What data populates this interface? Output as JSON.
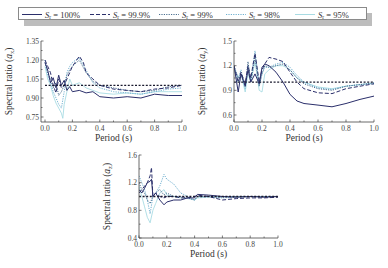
{
  "legend": {
    "entries": [
      {
        "label_main": "S",
        "label_sub": "r",
        "label_rest": " = 100%",
        "style": "solid",
        "color": "#2b2f6b"
      },
      {
        "label_main": "S",
        "label_sub": "r",
        "label_rest": " = 99.9%",
        "style": "dashed",
        "color": "#2b2f6b"
      },
      {
        "label_main": "S",
        "label_sub": "r",
        "label_rest": " = 99%",
        "style": "dotted",
        "color": "#4a6f8f"
      },
      {
        "label_main": "S",
        "label_sub": "r",
        "label_rest": " = 98%",
        "style": "dotted",
        "color": "#6fb0d0"
      },
      {
        "label_main": "S",
        "label_sub": "r",
        "label_rest": " = 95%",
        "style": "solid",
        "color": "#a8dbe3"
      }
    ]
  },
  "chart_data": [
    {
      "type": "line",
      "title": "",
      "xlabel": "Period (s)",
      "ylabel": "Spectral ratio (a_x)",
      "ylabel_main": "Spectral ratio (",
      "ylabel_var": "a",
      "ylabel_sub": "x",
      "xlim": [
        0.0,
        1.0
      ],
      "ylim": [
        0.72,
        1.35
      ],
      "xticks": [
        "0.0",
        "0.2",
        "0.4",
        "0.6",
        "0.8",
        "1.0"
      ],
      "yticks": [
        "0.75",
        "0.90",
        "1.05",
        "1.20",
        "1.35"
      ],
      "ytick_values": [
        0.75,
        0.9,
        1.05,
        1.2,
        1.35
      ],
      "grid": false,
      "reference_line": 1.0,
      "series": [
        {
          "name": "Sr = 100%",
          "x": [
            0.0,
            0.02,
            0.04,
            0.06,
            0.08,
            0.1,
            0.12,
            0.14,
            0.16,
            0.18,
            0.2,
            0.25,
            0.3,
            0.35,
            0.4,
            0.5,
            0.6,
            0.7,
            0.8,
            0.9,
            1.0
          ],
          "y": [
            1.18,
            1.12,
            1.02,
            1.06,
            0.98,
            1.08,
            1.0,
            1.04,
            0.96,
            0.99,
            0.95,
            0.96,
            0.94,
            0.95,
            0.91,
            0.9,
            0.91,
            0.9,
            0.93,
            0.92,
            0.92
          ]
        },
        {
          "name": "Sr = 99.9%",
          "x": [
            0.0,
            0.02,
            0.04,
            0.06,
            0.08,
            0.1,
            0.12,
            0.14,
            0.16,
            0.18,
            0.2,
            0.22,
            0.25,
            0.28,
            0.3,
            0.35,
            0.4,
            0.5,
            0.6,
            0.7,
            0.8,
            0.9,
            1.0
          ],
          "y": [
            1.2,
            1.15,
            1.1,
            1.0,
            0.94,
            1.05,
            0.98,
            1.0,
            1.05,
            1.1,
            1.15,
            1.18,
            1.23,
            1.18,
            1.1,
            1.05,
            1.0,
            0.97,
            0.96,
            0.95,
            0.97,
            0.98,
            1.0
          ]
        },
        {
          "name": "Sr = 99%",
          "x": [
            0.0,
            0.02,
            0.04,
            0.06,
            0.08,
            0.1,
            0.12,
            0.14,
            0.16,
            0.18,
            0.2,
            0.25,
            0.3,
            0.35,
            0.4,
            0.5,
            0.6,
            0.7,
            0.8,
            0.9,
            1.0
          ],
          "y": [
            1.18,
            1.1,
            1.05,
            0.98,
            1.02,
            0.92,
            0.95,
            1.0,
            1.08,
            1.12,
            1.15,
            1.2,
            1.1,
            1.03,
            1.0,
            0.98,
            0.96,
            0.95,
            0.96,
            0.99,
            1.0
          ]
        },
        {
          "name": "Sr = 98%",
          "x": [
            0.0,
            0.02,
            0.04,
            0.06,
            0.08,
            0.1,
            0.12,
            0.14,
            0.16,
            0.18,
            0.2,
            0.25,
            0.3,
            0.35,
            0.4,
            0.5,
            0.6,
            0.7,
            0.8,
            0.9,
            1.0
          ],
          "y": [
            1.2,
            1.08,
            1.02,
            0.95,
            0.9,
            0.85,
            0.82,
            0.95,
            1.1,
            1.15,
            1.18,
            1.22,
            1.12,
            1.02,
            0.98,
            0.95,
            0.94,
            0.93,
            0.95,
            0.97,
            0.98
          ]
        },
        {
          "name": "Sr = 95%",
          "x": [
            0.0,
            0.02,
            0.04,
            0.06,
            0.08,
            0.1,
            0.12,
            0.13,
            0.14,
            0.16,
            0.18,
            0.2,
            0.25,
            0.3,
            0.35,
            0.4,
            0.5,
            0.6,
            0.7,
            0.8,
            0.9,
            1.0
          ],
          "y": [
            1.15,
            1.05,
            1.0,
            0.92,
            0.86,
            0.82,
            0.78,
            0.74,
            0.85,
            0.95,
            1.05,
            1.0,
            1.02,
            0.98,
            0.96,
            0.94,
            0.93,
            0.94,
            0.93,
            0.95,
            0.95,
            0.95
          ]
        }
      ]
    },
    {
      "type": "line",
      "title": "",
      "xlabel": "Period (s)",
      "ylabel": "Spectral ratio (a_y)",
      "ylabel_main": "Spectral ratio (",
      "ylabel_var": "a",
      "ylabel_sub": "y",
      "xlim": [
        0.0,
        1.0
      ],
      "ylim": [
        0.54,
        1.5
      ],
      "xticks": [
        "0.0",
        "0.2",
        "0.4",
        "0.6",
        "0.8",
        "1.0"
      ],
      "yticks": [
        "0.6",
        "0.9",
        "1.2",
        "1.5"
      ],
      "ytick_values": [
        0.6,
        0.9,
        1.2,
        1.5
      ],
      "grid": false,
      "reference_line": 1.0,
      "series": [
        {
          "name": "Sr = 100%",
          "x": [
            0.0,
            0.03,
            0.05,
            0.08,
            0.1,
            0.12,
            0.15,
            0.18,
            0.2,
            0.22,
            0.25,
            0.3,
            0.35,
            0.4,
            0.45,
            0.5,
            0.6,
            0.7,
            0.8,
            0.9,
            1.0
          ],
          "y": [
            1.2,
            0.88,
            1.1,
            0.95,
            1.15,
            1.0,
            1.1,
            0.98,
            1.18,
            1.22,
            1.2,
            1.12,
            1.0,
            0.85,
            0.77,
            0.74,
            0.72,
            0.7,
            0.74,
            0.79,
            0.83
          ]
        },
        {
          "name": "Sr = 99.9%",
          "x": [
            0.0,
            0.03,
            0.05,
            0.08,
            0.1,
            0.12,
            0.15,
            0.18,
            0.2,
            0.22,
            0.25,
            0.3,
            0.35,
            0.4,
            0.45,
            0.5,
            0.6,
            0.7,
            0.8,
            0.9,
            1.0
          ],
          "y": [
            1.2,
            1.0,
            1.12,
            0.98,
            1.2,
            1.05,
            1.35,
            1.0,
            1.15,
            1.22,
            1.3,
            1.28,
            1.25,
            1.12,
            1.0,
            0.92,
            0.87,
            0.86,
            0.92,
            0.95,
            0.98
          ]
        },
        {
          "name": "Sr = 99%",
          "x": [
            0.0,
            0.03,
            0.05,
            0.08,
            0.1,
            0.12,
            0.15,
            0.18,
            0.2,
            0.22,
            0.25,
            0.3,
            0.35,
            0.4,
            0.45,
            0.5,
            0.6,
            0.7,
            0.8,
            0.9,
            1.0
          ],
          "y": [
            1.18,
            1.05,
            1.1,
            0.95,
            1.25,
            1.0,
            1.3,
            0.95,
            1.1,
            1.2,
            1.18,
            1.2,
            1.22,
            1.15,
            1.05,
            0.98,
            0.92,
            0.9,
            0.95,
            0.97,
            0.99
          ]
        },
        {
          "name": "Sr = 98%",
          "x": [
            0.0,
            0.03,
            0.05,
            0.08,
            0.1,
            0.12,
            0.15,
            0.18,
            0.2,
            0.22,
            0.25,
            0.3,
            0.35,
            0.4,
            0.45,
            0.5,
            0.6,
            0.7,
            0.8,
            0.9,
            1.0
          ],
          "y": [
            1.2,
            1.05,
            1.15,
            0.92,
            1.2,
            1.02,
            1.38,
            0.95,
            1.1,
            1.18,
            1.18,
            1.22,
            1.24,
            1.18,
            1.08,
            1.0,
            0.93,
            0.91,
            0.95,
            0.97,
            0.98
          ]
        },
        {
          "name": "Sr = 95%",
          "x": [
            0.0,
            0.03,
            0.05,
            0.08,
            0.1,
            0.12,
            0.15,
            0.18,
            0.2,
            0.22,
            0.25,
            0.3,
            0.35,
            0.4,
            0.45,
            0.5,
            0.6,
            0.7,
            0.8,
            0.9,
            1.0
          ],
          "y": [
            1.15,
            1.0,
            1.1,
            0.88,
            1.1,
            1.0,
            1.25,
            0.9,
            0.88,
            1.1,
            1.15,
            1.2,
            1.2,
            1.15,
            1.05,
            1.0,
            0.94,
            0.92,
            0.95,
            0.97,
            0.99
          ]
        }
      ]
    },
    {
      "type": "line",
      "title": "",
      "xlabel": "Period (s)",
      "ylabel": "Spectral ratio (a_z)",
      "ylabel_main": "Spectral ratio (",
      "ylabel_var": "a",
      "ylabel_sub": "z",
      "xlim": [
        0.0,
        1.0
      ],
      "ylim": [
        0.4,
        1.6
      ],
      "xticks": [
        "0.0",
        "0.2",
        "0.4",
        "0.6",
        "0.8",
        "1.0"
      ],
      "yticks": [
        "0.4",
        "0.8",
        "1.2",
        "1.6"
      ],
      "ytick_values": [
        0.4,
        0.8,
        1.2,
        1.6
      ],
      "grid": false,
      "reference_line": 1.0,
      "series": [
        {
          "name": "Sr = 100%",
          "x": [
            0.0,
            0.02,
            0.04,
            0.06,
            0.08,
            0.09,
            0.1,
            0.12,
            0.15,
            0.18,
            0.2,
            0.25,
            0.3,
            0.35,
            0.4,
            0.42,
            0.5,
            0.6,
            0.7,
            0.8,
            0.9,
            1.0
          ],
          "y": [
            1.1,
            1.05,
            1.12,
            1.2,
            1.22,
            1.25,
            1.0,
            1.05,
            0.95,
            0.88,
            0.92,
            0.95,
            0.95,
            0.98,
            0.98,
            1.03,
            1.02,
            1.0,
            0.99,
            1.0,
            0.99,
            1.0
          ]
        },
        {
          "name": "Sr = 99.9%",
          "x": [
            0.0,
            0.02,
            0.04,
            0.06,
            0.08,
            0.09,
            0.1,
            0.12,
            0.15,
            0.18,
            0.2,
            0.25,
            0.3,
            0.35,
            0.4,
            0.42,
            0.5,
            0.6,
            0.7,
            0.8,
            0.9,
            1.0
          ],
          "y": [
            1.05,
            1.1,
            1.15,
            1.2,
            1.3,
            1.42,
            1.0,
            1.05,
            1.0,
            0.98,
            1.0,
            1.0,
            0.98,
            0.98,
            1.0,
            1.02,
            1.0,
            0.95,
            0.97,
            0.98,
            0.98,
            0.99
          ]
        },
        {
          "name": "Sr = 99%",
          "x": [
            0.0,
            0.02,
            0.04,
            0.06,
            0.08,
            0.1,
            0.12,
            0.15,
            0.18,
            0.2,
            0.25,
            0.3,
            0.35,
            0.4,
            0.42,
            0.5,
            0.6,
            0.7,
            0.8,
            0.9,
            1.0
          ],
          "y": [
            1.2,
            1.1,
            1.05,
            0.95,
            0.9,
            1.0,
            1.05,
            1.1,
            1.02,
            1.05,
            1.0,
            1.0,
            0.98,
            0.95,
            1.0,
            1.0,
            0.99,
            1.0,
            1.0,
            1.0,
            1.0
          ]
        },
        {
          "name": "Sr = 98%",
          "x": [
            0.0,
            0.02,
            0.04,
            0.06,
            0.08,
            0.1,
            0.12,
            0.15,
            0.18,
            0.2,
            0.25,
            0.3,
            0.35,
            0.4,
            0.42,
            0.5,
            0.6,
            0.7,
            0.8,
            0.9,
            1.0
          ],
          "y": [
            1.3,
            1.2,
            1.1,
            0.95,
            0.75,
            1.0,
            1.05,
            1.15,
            1.32,
            1.25,
            1.18,
            1.05,
            1.0,
            0.95,
            1.0,
            1.0,
            0.98,
            0.99,
            1.0,
            1.0,
            1.0
          ]
        },
        {
          "name": "Sr = 95%",
          "x": [
            0.0,
            0.02,
            0.04,
            0.06,
            0.08,
            0.1,
            0.12,
            0.15,
            0.18,
            0.2,
            0.25,
            0.3,
            0.35,
            0.4,
            0.42,
            0.5,
            0.6,
            0.7,
            0.8,
            0.9,
            1.0
          ],
          "y": [
            1.15,
            1.0,
            0.85,
            0.7,
            0.62,
            0.8,
            0.9,
            1.05,
            1.1,
            1.02,
            1.0,
            0.98,
            0.97,
            0.95,
            0.98,
            0.99,
            1.0,
            1.0,
            1.0,
            1.0,
            1.0
          ]
        }
      ]
    }
  ]
}
